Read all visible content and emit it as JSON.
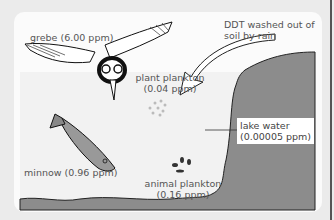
{
  "diagram": {
    "organisms": [
      {
        "name": "grebe",
        "label": "grebe (6.00 ppm)",
        "ppm": 6.0
      },
      {
        "name": "plant plankton",
        "label_line1": "plant plankton",
        "label_line2": "(0.04 ppm)",
        "ppm": 0.04
      },
      {
        "name": "minnow",
        "label": "minnow (0.96 ppm)",
        "ppm": 0.96
      },
      {
        "name": "animal plankton",
        "label_line1": "animal plankton",
        "label_line2": "(0.16 ppm)",
        "ppm": 0.16
      }
    ],
    "lake_water": {
      "label_line1": "lake water",
      "label_line2": "(0.00005 ppm)",
      "ppm": 5e-05
    },
    "arrow_caption": {
      "line1": "DDT washed out of",
      "line2": "soil by rain"
    },
    "colors": {
      "soil": "#8c8c8c",
      "water": "#f2f2f2",
      "card": "#fbfbfb",
      "background": "#ebebeb"
    }
  }
}
